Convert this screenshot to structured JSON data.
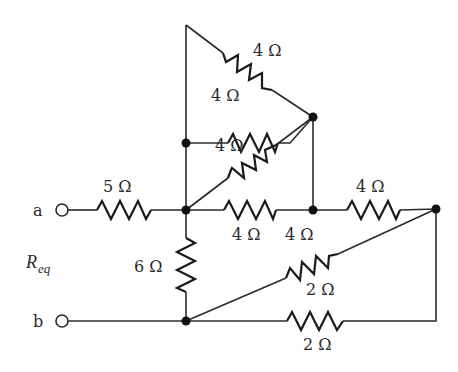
{
  "diagram": {
    "type": "resistor-network",
    "terminals": [
      {
        "id": "a",
        "label": "a"
      },
      {
        "id": "b",
        "label": "b"
      }
    ],
    "measured_quantity": {
      "symbol": "R",
      "subscript": "eq"
    },
    "resistors": [
      {
        "id": "R1",
        "label": "5 Ω",
        "value_ohms": 5,
        "between": [
          "a",
          "C"
        ]
      },
      {
        "id": "R2",
        "label": "4 Ω",
        "value_ohms": 4,
        "between": [
          "top-corner",
          "B"
        ]
      },
      {
        "id": "R3",
        "label": "4 Ω",
        "value_ohms": 4,
        "between": [
          "A",
          "B"
        ]
      },
      {
        "id": "R4",
        "label": "4 Ω",
        "value_ohms": 4,
        "between": [
          "C",
          "B"
        ]
      },
      {
        "id": "R5",
        "label": "4 Ω",
        "value_ohms": 4,
        "between": [
          "C",
          "D"
        ]
      },
      {
        "id": "R6",
        "label": "4 Ω",
        "value_ohms": 4,
        "between": [
          "D",
          "E"
        ]
      },
      {
        "id": "R7",
        "label": "6 Ω",
        "value_ohms": 6,
        "between": [
          "C",
          "F"
        ]
      },
      {
        "id": "R8",
        "label": "2 Ω",
        "value_ohms": 2,
        "between": [
          "F",
          "E"
        ]
      },
      {
        "id": "R9",
        "label": "2 Ω",
        "value_ohms": 2,
        "between": [
          "F",
          "E"
        ]
      }
    ],
    "extra_labels": [
      {
        "id": "d_label",
        "label": "4 Ω"
      }
    ],
    "colors": {
      "line": "#2a2a2a",
      "node": "#111111",
      "background": "#ffffff"
    }
  }
}
